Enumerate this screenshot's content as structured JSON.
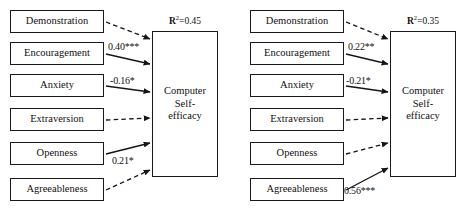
{
  "figure": {
    "type": "path-diagram",
    "panels": [
      {
        "id": "left",
        "outcome": {
          "line1": "Computer",
          "line2": "Self-",
          "line3": "efficacy"
        },
        "r2": {
          "symbol": "R",
          "exponent": "2",
          "equals": "=",
          "value": "0.45"
        },
        "predictors": [
          {
            "label": "Demonstration",
            "path_style": "dashed",
            "coefficient": "",
            "significant": false
          },
          {
            "label": "Encouragement",
            "path_style": "solid",
            "coefficient": "0.40***",
            "significant": true
          },
          {
            "label": "Anxiety",
            "path_style": "solid",
            "coefficient": "-0.16*",
            "significant": true
          },
          {
            "label": "Extraversion",
            "path_style": "dashed",
            "coefficient": "",
            "significant": false
          },
          {
            "label": "Openness",
            "path_style": "solid",
            "coefficient": "0.21*",
            "significant": true
          },
          {
            "label": "Agreeableness",
            "path_style": "dashed",
            "coefficient": "",
            "significant": false
          }
        ]
      },
      {
        "id": "right",
        "outcome": {
          "line1": "Computer",
          "line2": "Self-",
          "line3": "efficacy"
        },
        "r2": {
          "symbol": "R",
          "exponent": "2",
          "equals": "=",
          "value": "0.35"
        },
        "predictors": [
          {
            "label": "Demonstration",
            "path_style": "dashed",
            "coefficient": "",
            "significant": false
          },
          {
            "label": "Encouragement",
            "path_style": "solid",
            "coefficient": "0.22**",
            "significant": true
          },
          {
            "label": "Anxiety",
            "path_style": "solid",
            "coefficient": "-0.21*",
            "significant": true
          },
          {
            "label": "Extraversion",
            "path_style": "dashed",
            "coefficient": "",
            "significant": false
          },
          {
            "label": "Openness",
            "path_style": "dashed",
            "coefficient": "",
            "significant": false
          },
          {
            "label": "Agreeableness",
            "path_style": "solid",
            "coefficient": "0.56***",
            "significant": true
          }
        ]
      }
    ],
    "colors": {
      "stroke": "#151515",
      "text": "#111111",
      "background": "#ffffff"
    }
  }
}
